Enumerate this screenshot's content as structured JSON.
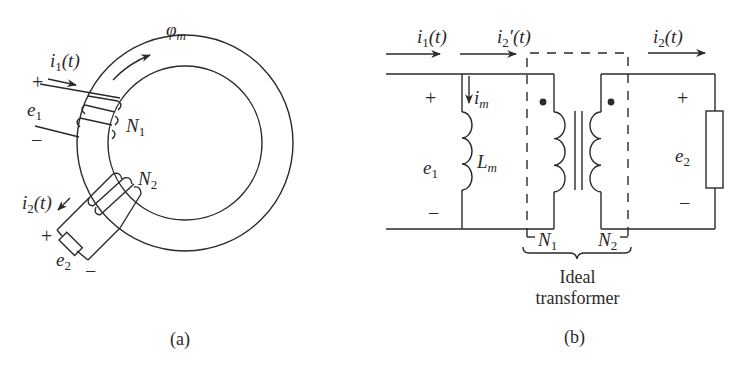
{
  "figure_a": {
    "caption": "(a)",
    "flux": {
      "symbol": "φ",
      "sub": "m"
    },
    "current_1": {
      "symbol": "i",
      "sub": "1",
      "arg": "(t)"
    },
    "current_2": {
      "symbol": "i",
      "sub": "2",
      "arg": "(t)"
    },
    "emf_1": {
      "symbol": "e",
      "sub": "1"
    },
    "emf_2": {
      "symbol": "e",
      "sub": "2"
    },
    "winding_1": {
      "symbol": "N",
      "sub": "1"
    },
    "winding_2": {
      "symbol": "N",
      "sub": "2"
    },
    "plus": "+",
    "minus": "−"
  },
  "figure_b": {
    "caption": "(b)",
    "current_1": {
      "symbol": "i",
      "sub": "1",
      "arg": "(t)"
    },
    "current_2_prime": {
      "symbol": "i",
      "sub": "2",
      "prime": "′",
      "arg": "(t)"
    },
    "current_2": {
      "symbol": "i",
      "sub": "2",
      "arg": "(t)"
    },
    "magnetizing_current": {
      "symbol": "i",
      "sub": "m"
    },
    "magnetizing_inductance": {
      "symbol": "L",
      "sub": "m"
    },
    "emf_1": {
      "symbol": "e",
      "sub": "1"
    },
    "emf_2": {
      "symbol": "e",
      "sub": "2"
    },
    "turns_1": {
      "symbol": "N",
      "sub": "1"
    },
    "turns_2": {
      "symbol": "N",
      "sub": "2"
    },
    "brace_label_line1": "Ideal",
    "brace_label_line2": "transformer",
    "plus": "+",
    "minus": "−"
  },
  "colors": {
    "ink": "#2a2a2a",
    "background": "#ffffff"
  }
}
